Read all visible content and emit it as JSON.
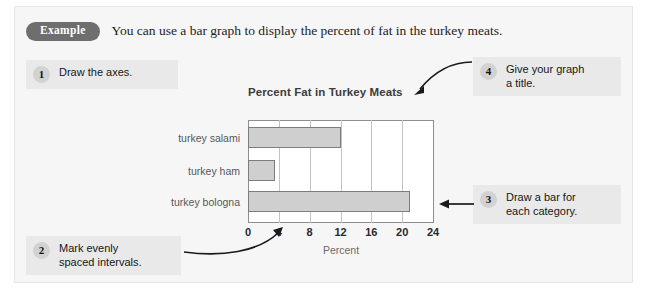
{
  "example": {
    "badge_label": "Example",
    "sentence": "You can use a bar graph to display the percent of fat in the turkey meats."
  },
  "steps": [
    {
      "number": "1",
      "text": "Draw the axes."
    },
    {
      "number": "2",
      "text": "Mark evenly\nspaced intervals."
    },
    {
      "number": "3",
      "text": "Draw a bar for\neach category."
    },
    {
      "number": "4",
      "text": "Give your graph\na title."
    }
  ],
  "chart_data": {
    "type": "bar",
    "orientation": "horizontal",
    "title": "Percent Fat in Turkey Meats",
    "categories": [
      "turkey salami",
      "turkey ham",
      "turkey bologna"
    ],
    "values": [
      12,
      3.5,
      21
    ],
    "xlabel": "Percent",
    "ylabel": "",
    "xticks": [
      "0",
      "4",
      "8",
      "12",
      "16",
      "20",
      "24"
    ],
    "xtick_values": [
      0,
      4,
      8,
      12,
      16,
      20,
      24
    ],
    "xlim": [
      0,
      24
    ],
    "grid": "vertical",
    "legend": "none",
    "bar_fill": "#cfcfcf",
    "bar_border": "#7d7d7d"
  },
  "colors": {
    "panel_background": "#f6f6f6",
    "callout_background": "#e9e9e9",
    "badge_background": "#6e6e6e",
    "step_circle": "#d2d2d2",
    "arrow": "#1a1a1a"
  }
}
